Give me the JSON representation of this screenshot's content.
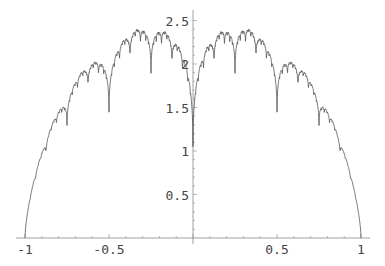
{
  "chart_data": {
    "type": "line",
    "title": "",
    "xlabel": "",
    "ylabel": "",
    "xlim": [
      -1,
      1
    ],
    "ylim": [
      0,
      2.6
    ],
    "grid": false,
    "legend": null,
    "x_ticks": [
      {
        "value": -1,
        "label": "-1"
      },
      {
        "value": -0.5,
        "label": "-0.5"
      },
      {
        "value": 0.5,
        "label": "0.5"
      },
      {
        "value": 1,
        "label": "1"
      }
    ],
    "y_ticks": [
      {
        "value": 0.5,
        "label": "0.5"
      },
      {
        "value": 1,
        "label": "1"
      },
      {
        "value": 1.5,
        "label": "1.5"
      },
      {
        "value": 2,
        "label": "2"
      },
      {
        "value": 2.5,
        "label": "2.5"
      }
    ],
    "series": [
      {
        "name": "fractal curve",
        "color": "#555555",
        "description": "Symmetric fractal (Takagi-like) curve over a semicircular envelope, zero at x=±1, local minimum ≈1.05 at x=0, peaks ≈2.5 near x=±0.38, deep dips at dyadic rationals",
        "x": [
          -1,
          -0.9,
          -0.75,
          -0.625,
          -0.5,
          -0.375,
          -0.25,
          -0.125,
          0,
          0.125,
          0.25,
          0.375,
          0.5,
          0.625,
          0.75,
          0.9,
          1
        ],
        "y": [
          0,
          1.1,
          1.25,
          1.9,
          1.35,
          2.5,
          1.8,
          2.2,
          1.05,
          2.2,
          1.8,
          2.5,
          1.35,
          1.9,
          1.25,
          1.1,
          0
        ]
      }
    ]
  }
}
